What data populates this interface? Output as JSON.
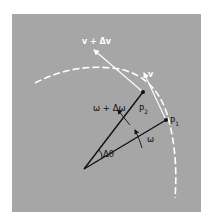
{
  "diagram": {
    "colors": {
      "background": "#a6a6a6",
      "page": "#ffffff",
      "radius_line": "#111111",
      "arc": "#ffffff",
      "velocity": "#ffffff"
    },
    "labels": {
      "v_plus_dv": "v + Δv",
      "v": "v",
      "omega_plus_domega": "ω + Δω",
      "omega": "ω",
      "delta_theta": "Δθ",
      "p2_main": "P",
      "p2_sub": "2",
      "p1_main": "P",
      "p1_sub": "1"
    },
    "points": {
      "center": [
        84,
        169
      ],
      "P1": [
        166,
        120
      ],
      "P2": [
        143,
        92
      ]
    }
  }
}
